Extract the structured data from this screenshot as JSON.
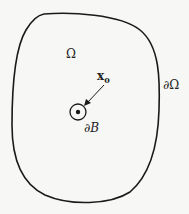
{
  "diagram": {
    "type": "domain-with-small-ball",
    "labels": {
      "domain": "Ω",
      "domain_boundary": "∂Ω",
      "point": "x",
      "point_subscript": "0",
      "ball_boundary": "∂B"
    },
    "colors": {
      "stroke": "#1a1a1a",
      "background": "#f7f7f5",
      "text": "#222222"
    }
  }
}
